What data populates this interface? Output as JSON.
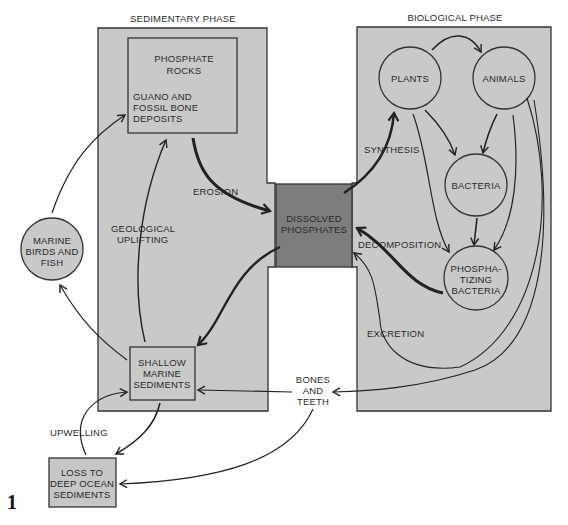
{
  "figure_number": "1",
  "colors": {
    "panel_fill": "#c9c9c9",
    "box_fill": "#c6c6c6",
    "dissolved_fill": "#7d7d7d",
    "stroke": "#222222",
    "background": "#ffffff"
  },
  "phases": {
    "sedimentary": "SEDIMENTARY PHASE",
    "biological": "BIOLOGICAL PHASE"
  },
  "nodes": {
    "phosphate_rocks": {
      "title": [
        "PHOSPHATE",
        "ROCKS"
      ],
      "sub": [
        "GUANO AND",
        "FOSSIL BONE",
        "DEPOSITS"
      ]
    },
    "dissolved_phosphates": [
      "DISSOLVED",
      "PHOSPHATES"
    ],
    "marine_birds": [
      "MARINE",
      "BIRDS AND",
      "FISH"
    ],
    "shallow_sediments": [
      "SHALLOW",
      "MARINE",
      "SEDIMENTS"
    ],
    "deep_ocean": [
      "LOSS TO",
      "DEEP OCEAN",
      "SEDIMENTS"
    ],
    "plants": "PLANTS",
    "animals": "ANIMALS",
    "bacteria": "BACTERIA",
    "phosphatizing": [
      "PHOSPHA-",
      "TIZING",
      "BACTERIA"
    ],
    "bones_teeth": [
      "BONES",
      "AND",
      "TEETH"
    ]
  },
  "processes": {
    "erosion": "EROSION",
    "geological_uplifting": [
      "GEOLOGICAL",
      "UPLIFTING"
    ],
    "synthesis": "SYNTHESIS",
    "decomposition": "DECOMPOSITION",
    "excretion": "EXCRETION",
    "upwelling": "UPWELLING"
  }
}
